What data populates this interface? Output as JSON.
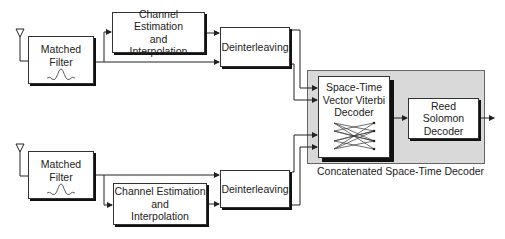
{
  "diagram": {
    "top_branch": {
      "matched_filter": {
        "line1": "Matched",
        "line2": "Filter",
        "icon": "sinc-pulse-icon"
      },
      "channel_estimation": {
        "line1": "Channel Estimation",
        "line2": "and",
        "line3": "Interpolation"
      },
      "deinterleaving": {
        "label": "Deinterleaving"
      },
      "antenna_icon": "antenna-icon"
    },
    "bottom_branch": {
      "matched_filter": {
        "line1": "Matched",
        "line2": "Filter",
        "icon": "sinc-pulse-icon"
      },
      "channel_estimation": {
        "line1": "Channel Estimation",
        "line2": "and",
        "line3": "Interpolation"
      },
      "deinterleaving": {
        "label": "Deinterleaving"
      },
      "antenna_icon": "antenna-icon"
    },
    "decoder": {
      "container_label": "Concatenated Space-Time Decoder",
      "viterbi": {
        "line1": "Space-Time",
        "line2": "Vector Viterbi",
        "line3": "Decoder",
        "icon": "trellis-icon"
      },
      "reed_solomon": {
        "line1": "Reed Solomon",
        "line2": "Decoder"
      }
    },
    "colors": {
      "container_fill": "#d9d9d9",
      "line": "#222222",
      "box_fill": "#ffffff"
    }
  }
}
